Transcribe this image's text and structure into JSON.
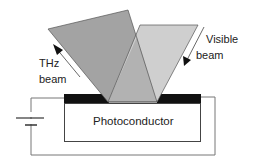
{
  "diagram": {
    "labels": {
      "thz_line1": "THz",
      "thz_line2": "beam",
      "visible_line1": "Visible",
      "visible_line2": "beam",
      "photoconductor": "Photoconductor"
    },
    "colors": {
      "thz_beam": "#a3a3a3",
      "visible_beam": "#cfcfcf",
      "overlap": "#b3b3b3",
      "electrode": "#111111",
      "wire": "#666666"
    }
  }
}
